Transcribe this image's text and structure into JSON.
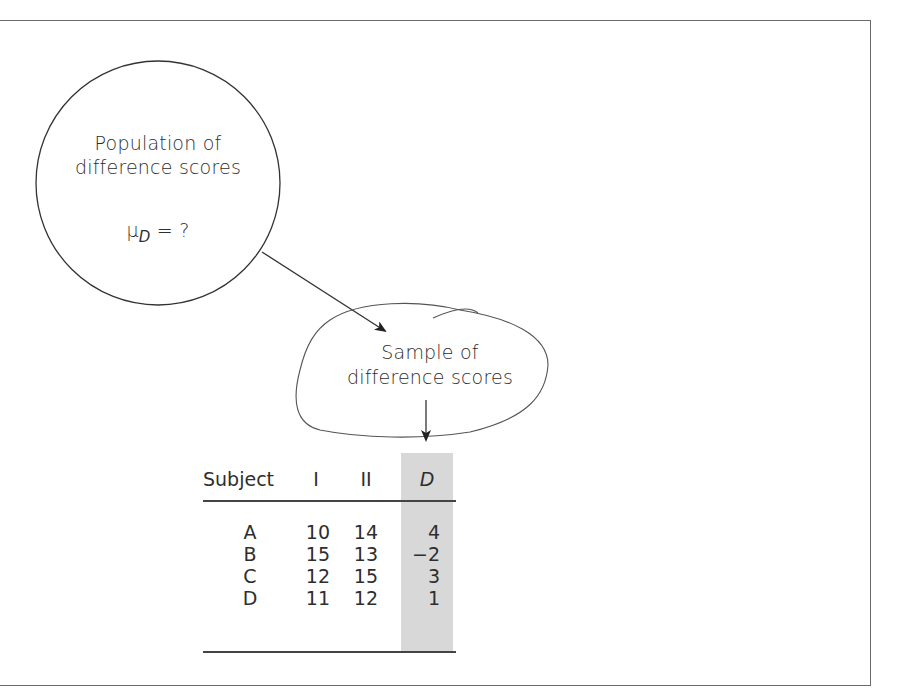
{
  "population": {
    "line1": "Population of",
    "line2": "difference scores",
    "mu_symbol": "μ",
    "mu_subscript": "D",
    "mu_rest": " = ?"
  },
  "sample": {
    "line1": "Sample of",
    "line2": "difference scores"
  },
  "table": {
    "headers": {
      "subject": "Subject",
      "col1": "I",
      "col2": "II",
      "diff": "D"
    },
    "rows": [
      {
        "subject": "A",
        "i": "10",
        "ii": "14",
        "d": "4"
      },
      {
        "subject": "B",
        "i": "15",
        "ii": "13",
        "d": "−2"
      },
      {
        "subject": "C",
        "i": "12",
        "ii": "15",
        "d": "3"
      },
      {
        "subject": "D",
        "i": "11",
        "ii": "12",
        "d": "1"
      }
    ]
  },
  "colors": {
    "shade": "#d8d8d8",
    "line": "#444444",
    "text": "#2e2e2e"
  }
}
